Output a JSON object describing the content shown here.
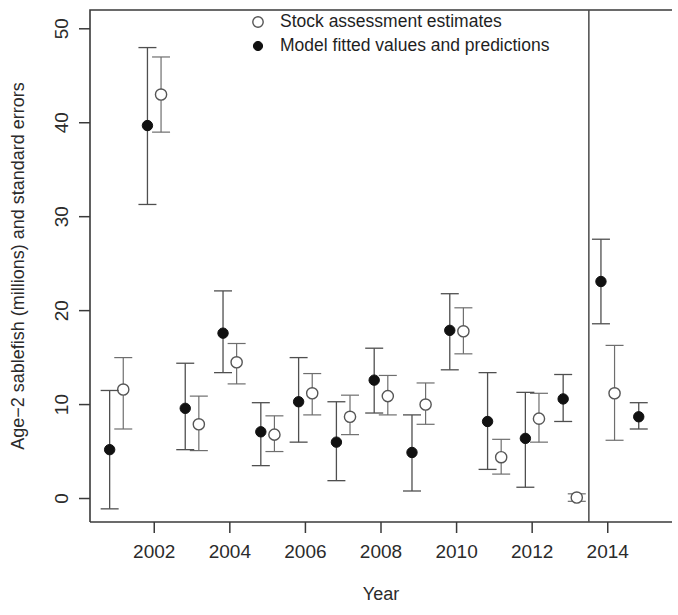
{
  "chart_data": {
    "type": "scatter",
    "title": "",
    "xlabel": "Year",
    "ylabel": "Age−2 sablefish (millions) and standard errors",
    "xlim": [
      2000.3,
      2015.7
    ],
    "ylim": [
      -2.5,
      52
    ],
    "grid": false,
    "legend_position": "top-center",
    "x": [
      2001,
      2002,
      2003,
      2004,
      2005,
      2006,
      2007,
      2008,
      2009,
      2010,
      2011,
      2012,
      2013,
      2014,
      2015
    ],
    "xticks": [
      2002,
      2004,
      2006,
      2008,
      2010,
      2012,
      2014
    ],
    "xtick_labels": [
      "2002",
      "2004",
      "2006",
      "2008",
      "2010",
      "2012",
      "2014"
    ],
    "yticks": [
      0,
      10,
      20,
      30,
      40,
      50
    ],
    "ytick_labels": [
      "0",
      "10",
      "20",
      "30",
      "40",
      "50"
    ],
    "divider_x": 2013.5,
    "divider_note": "vertical line separating fitted period from prediction period",
    "series": [
      {
        "name": "Stock assessment estimates",
        "marker": "open-circle",
        "color": "#555555",
        "x_offset": 0.18,
        "values": [
          11.6,
          43.0,
          7.9,
          14.5,
          6.8,
          11.2,
          8.7,
          10.9,
          10.0,
          17.8,
          4.4,
          8.5,
          0.1,
          11.2,
          null
        ],
        "err_low": [
          7.4,
          39.0,
          5.1,
          12.2,
          5.0,
          8.9,
          6.8,
          8.9,
          7.9,
          15.4,
          2.6,
          6.0,
          -0.3,
          6.2,
          null
        ],
        "err_high": [
          15.0,
          47.0,
          10.9,
          16.5,
          8.8,
          13.3,
          11.0,
          13.1,
          12.3,
          20.3,
          6.3,
          11.2,
          0.5,
          16.3,
          null
        ]
      },
      {
        "name": "Model fitted values and predictions",
        "marker": "filled-circle",
        "color": "#111111",
        "x_offset": -0.18,
        "values": [
          5.2,
          39.7,
          9.6,
          17.6,
          7.1,
          10.3,
          6.0,
          12.6,
          4.9,
          17.9,
          8.2,
          6.4,
          10.6,
          23.1,
          8.7
        ],
        "err_low": [
          -1.1,
          31.3,
          5.2,
          13.4,
          3.5,
          6.0,
          1.9,
          9.1,
          0.8,
          13.7,
          3.1,
          1.2,
          8.2,
          18.6,
          7.4
        ],
        "err_high": [
          11.5,
          48.0,
          14.4,
          22.1,
          10.2,
          15.0,
          10.3,
          16.0,
          8.9,
          21.8,
          13.4,
          11.3,
          13.2,
          27.6,
          10.2
        ]
      }
    ],
    "legend": [
      {
        "label": "Stock assessment estimates",
        "marker": "open-circle"
      },
      {
        "label": "Model fitted values and predictions",
        "marker": "filled-circle"
      }
    ]
  }
}
